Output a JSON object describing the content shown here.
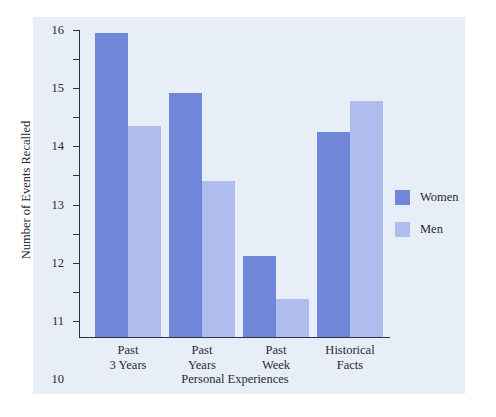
{
  "chart_data": {
    "type": "bar",
    "title": "",
    "xlabel": "Personal Experiences",
    "ylabel": "Number of Events Recalled",
    "categories": [
      "Past\n3 Years",
      "Past\nYears",
      "Past\nWeek",
      "Historical\nFacts"
    ],
    "category_lines": [
      [
        "Past",
        "3 Years"
      ],
      [
        "Past",
        "Years"
      ],
      [
        "Past",
        "Week"
      ],
      [
        "Historical",
        "Facts"
      ]
    ],
    "series": [
      {
        "name": "Women",
        "color": "#7086d8",
        "values": [
          15.9,
          13.85,
          8.25,
          12.5
        ]
      },
      {
        "name": "Men",
        "color": "#aebdee",
        "values": [
          12.7,
          10.8,
          6.75,
          13.55
        ]
      }
    ],
    "ylim": [
      5.45,
      16.0
    ],
    "yticks": [
      6,
      7,
      8,
      9,
      10,
      11,
      12,
      13,
      14,
      15,
      16
    ],
    "ytick_labels": [
      "6",
      "7",
      "8",
      "9",
      "10",
      "11",
      "12",
      "13",
      "14",
      "15",
      "16"
    ],
    "grid": false,
    "legend_position": "right",
    "legend": [
      "Women",
      "Men"
    ],
    "panel_background": "#e8eef8",
    "axis_color": "#2b3342"
  }
}
